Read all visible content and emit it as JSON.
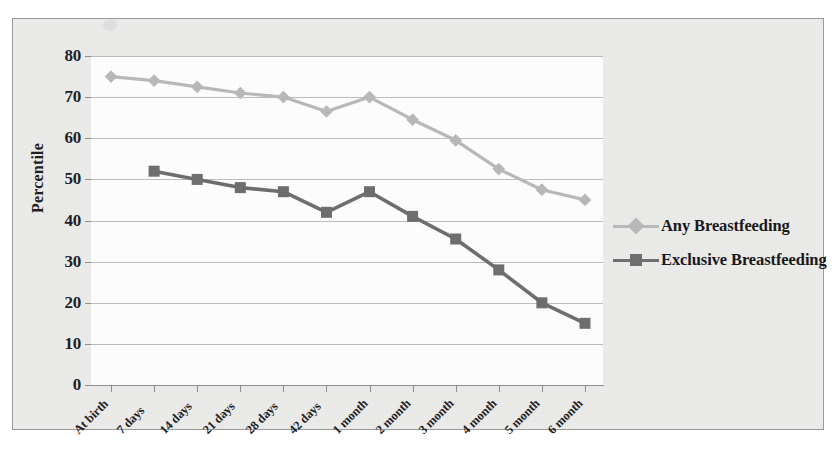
{
  "chart_data": {
    "type": "line",
    "title": "",
    "xlabel": "",
    "ylabel": "Percentile",
    "ylim": [
      0,
      80
    ],
    "ytick_step": 10,
    "grid": true,
    "legend_position": "right",
    "categories": [
      "At birth",
      "7 days",
      "14 days",
      "21 days",
      "28 days",
      "42 days",
      "1 month",
      "2 month",
      "3 month",
      "4 month",
      "5 month",
      "6 month"
    ],
    "yticks": [
      "0",
      "10",
      "20",
      "30",
      "40",
      "50",
      "60",
      "70",
      "80"
    ],
    "series": [
      {
        "name": "Any Breastfeeding",
        "color": "#b9b9b9",
        "marker": "diamond",
        "values": [
          75,
          74,
          72.5,
          71,
          70,
          66.5,
          70,
          64.5,
          59.5,
          52.5,
          47.5,
          45
        ]
      },
      {
        "name": "Exclusive Breastfeeding",
        "color": "#6d6d6d",
        "marker": "square",
        "values": [
          null,
          52,
          50,
          48,
          47,
          42,
          47,
          41,
          35.5,
          28,
          20,
          15
        ]
      }
    ]
  },
  "legend": {
    "items": [
      {
        "label": "Any Breastfeeding",
        "color": "#b9b9b9",
        "marker": "diamond"
      },
      {
        "label": "Exclusive Breastfeeding",
        "color": "#6d6d6d",
        "marker": "square"
      }
    ]
  },
  "axis": {
    "y_title": "Percentile"
  },
  "colors": {
    "any_breastfeeding": "#b9b9b9",
    "exclusive_breastfeeding": "#6d6d6d",
    "gridline": "#bdbdbd",
    "frame_background": "#ececeb",
    "plot_background": "#ffffff",
    "text": "#1d1d1d"
  }
}
